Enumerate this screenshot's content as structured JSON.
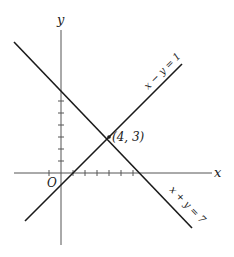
{
  "diagram": {
    "type": "coordinate-plane",
    "axes": {
      "x_label": "x",
      "y_label": "y",
      "origin_label": "O",
      "unit_px": 12,
      "origin_px": [
        61,
        173
      ]
    },
    "lines": [
      {
        "equation": "x + y = 7",
        "label": "x + y = 7"
      },
      {
        "equation": "x − y = 1",
        "label": "x − y = 1"
      }
    ],
    "intersection": {
      "x": 4,
      "y": 3,
      "label": "(4, 3)"
    },
    "colors": {
      "line": "#1a1a1a",
      "axis": "#555555",
      "background": "#ffffff"
    }
  }
}
